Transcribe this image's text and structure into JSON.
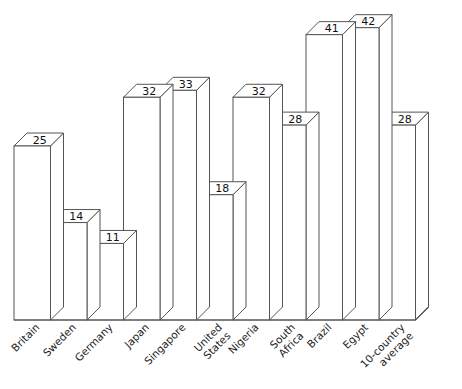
{
  "chart_data": {
    "type": "bar",
    "title": "",
    "subtitle": "",
    "xlabel": "",
    "ylabel": "",
    "ylim": [
      0,
      46
    ],
    "grid": false,
    "legend": "none",
    "style": "3d-isometric-bars-outline-only",
    "categories": [
      "Britain",
      "Sweden",
      "Germany",
      "Japan",
      "Singapore",
      "United\nStates",
      "Nigeria",
      "South\nAfrica",
      "Brazil",
      "Egypt",
      "10-country\naverage"
    ],
    "values": [
      25,
      14,
      11,
      32,
      33,
      18,
      32,
      28,
      41,
      42,
      28
    ],
    "data_labels": [
      "25",
      "14",
      "11",
      "32",
      "33",
      "18",
      "32",
      "28",
      "41",
      "42",
      "28"
    ],
    "axis": {
      "tick_labels_rotated_degrees": 45,
      "baseline_visible": true,
      "value_axis_visible": false
    },
    "colors": {
      "bar_fill": "#ffffff",
      "bar_stroke": "#555555",
      "axis": "#555555",
      "label_text": "#222222",
      "value_text": "#111111",
      "background": "#ffffff"
    }
  },
  "chart": {
    "categories": [
      {
        "line1": "Britain",
        "line2": ""
      },
      {
        "line1": "Sweden",
        "line2": ""
      },
      {
        "line1": "Germany",
        "line2": ""
      },
      {
        "line1": "Japan",
        "line2": ""
      },
      {
        "line1": "Singapore",
        "line2": ""
      },
      {
        "line1": "United",
        "line2": "States"
      },
      {
        "line1": "Nigeria",
        "line2": ""
      },
      {
        "line1": "South",
        "line2": "Africa"
      },
      {
        "line1": "Brazil",
        "line2": ""
      },
      {
        "line1": "Egypt",
        "line2": ""
      },
      {
        "line1": "10-country",
        "line2": "average"
      }
    ],
    "labels": [
      "25",
      "14",
      "11",
      "32",
      "33",
      "18",
      "32",
      "28",
      "41",
      "42",
      "28"
    ]
  }
}
